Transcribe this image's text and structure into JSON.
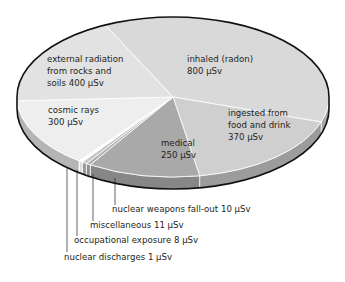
{
  "chart_data": {
    "type": "pie",
    "title": "",
    "unit": "µSv",
    "style": "3d-tilted",
    "slices": [
      {
        "name": "inhaled (radon)",
        "label_lines": [
          "inhaled (radon)",
          "800 µSv"
        ],
        "value": 800,
        "color": "#d9d9d9",
        "side_color": "#a6a6a6"
      },
      {
        "name": "ingested from food and drink",
        "label_lines": [
          "ingested from",
          "food and drink",
          "370 µSv"
        ],
        "value": 370,
        "color": "#cfcfcf",
        "side_color": "#9c9c9c"
      },
      {
        "name": "medical",
        "label_lines": [
          "medical",
          "250 µSv"
        ],
        "value": 250,
        "color": "#a9a9a9",
        "side_color": "#878787"
      },
      {
        "name": "nuclear weapons fall-out",
        "label_lines": [
          "nuclear weapons fall-out 10 µSv"
        ],
        "value": 10,
        "color": "#b0b0b0",
        "side_color": "#8e8e8e"
      },
      {
        "name": "miscellaneous",
        "label_lines": [
          "miscellaneous 11 µSv"
        ],
        "value": 11,
        "color": "#c4c4c4",
        "side_color": "#999999"
      },
      {
        "name": "occupational exposure",
        "label_lines": [
          "occupational exposure 8 µSv"
        ],
        "value": 8,
        "color": "#ffffff",
        "side_color": "#dcdcdc"
      },
      {
        "name": "nuclear discharges",
        "label_lines": [
          "nuclear discharges 1 µSv"
        ],
        "value": 1,
        "color": "#f0f0f0",
        "side_color": "#bdbdbd"
      },
      {
        "name": "cosmic rays",
        "label_lines": [
          "cosmic rays",
          "300 µSv"
        ],
        "value": 300,
        "color": "#eeeeee",
        "side_color": "#b5b5b5"
      },
      {
        "name": "external radiation from rocks and soils",
        "label_lines": [
          "external radiation",
          "from rocks and",
          "soils 400 µSv"
        ],
        "value": 400,
        "color": "#e2e2e2",
        "side_color": "#adadad"
      }
    ],
    "legend": "none",
    "callouts": [
      "nuclear weapons fall-out",
      "miscellaneous",
      "occupational exposure",
      "nuclear discharges"
    ]
  }
}
